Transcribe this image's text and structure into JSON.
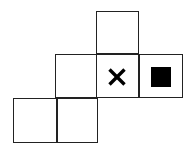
{
  "figure": {
    "canvas": {
      "width": 196,
      "height": 155,
      "background": "#ffffff"
    },
    "style": {
      "cell_size": 43,
      "line_color": "#222222",
      "line_width": 1.4,
      "mark_color": "#000000",
      "fill_color": "#ffffff"
    },
    "cells": [
      {
        "name": "top-square",
        "x": 96,
        "y": 11,
        "w": 43,
        "h": 43,
        "row": "top",
        "column": 3,
        "mark": "none"
      },
      {
        "name": "middle-square-left",
        "x": 55,
        "y": 54,
        "w": 42,
        "h": 44,
        "row": "middle",
        "column": 2,
        "mark": "none"
      },
      {
        "name": "middle-square-center",
        "x": 96,
        "y": 54,
        "w": 43,
        "h": 44,
        "row": "middle",
        "column": 3,
        "mark": "cross"
      },
      {
        "name": "middle-square-right",
        "x": 139,
        "y": 54,
        "w": 44,
        "h": 44,
        "row": "middle",
        "column": 4,
        "mark": "filled-square"
      },
      {
        "name": "bottom-square-left",
        "x": 13,
        "y": 98,
        "w": 44,
        "h": 45,
        "row": "bottom",
        "column": 1,
        "mark": "none"
      },
      {
        "name": "bottom-square-right",
        "x": 57,
        "y": 98,
        "w": 41,
        "h": 45,
        "row": "bottom",
        "column": 2,
        "mark": "none"
      }
    ],
    "marks": [
      {
        "name": "cross-mark",
        "symbol": "×",
        "in_cell": "middle-square-center",
        "center_x": 117,
        "center_y": 77,
        "size": 15,
        "color": "#000000"
      },
      {
        "name": "filled-square-mark",
        "symbol": "■",
        "in_cell": "middle-square-right",
        "x": 151,
        "y": 67,
        "w": 20,
        "h": 20,
        "color": "#000000"
      }
    ]
  }
}
